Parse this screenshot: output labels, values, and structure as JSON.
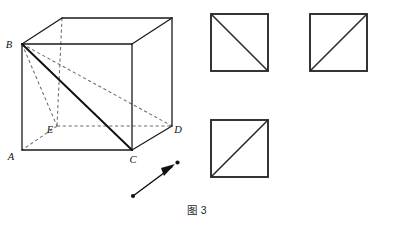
{
  "figure": {
    "caption": "图 3",
    "domain": "geometry-diagram",
    "background_color": "#ffffff",
    "stroke_color": "#111111",
    "hidden_stroke_color": "#6d6d6d"
  },
  "cube": {
    "title": "labelled cube with space diagonal",
    "vertices": {
      "A": {
        "label": "A",
        "x": 22,
        "y": 150,
        "label_x": 10,
        "label_y": 156
      },
      "B": {
        "label": "B",
        "x": 22,
        "y": 44,
        "label_x": 9,
        "label_y": 44
      },
      "C": {
        "label": "C",
        "x": 132,
        "y": 150,
        "label_x": 129,
        "label_y": 161
      },
      "D": {
        "label": "D",
        "x": 172,
        "y": 126,
        "label_x": 175,
        "label_y": 132
      },
      "E": {
        "label": "E",
        "x": 57,
        "y": 126,
        "label_x": 47,
        "label_y": 132
      },
      "F_top_front_right": {
        "x": 132,
        "y": 44
      },
      "G_top_back_left": {
        "x": 62,
        "y": 18
      },
      "H_top_back_right": {
        "x": 172,
        "y": 18
      }
    },
    "visible_edges": [
      "A-B",
      "A-C",
      "C-F",
      "B-F",
      "B-G",
      "G-H",
      "H-F",
      "H-D",
      "C-D"
    ],
    "hidden_edges": [
      "G-E",
      "E-A",
      "E-D"
    ],
    "bold_diagonal": "B-C",
    "construction_lines": [
      "B-E",
      "B-D",
      "B-C-dashed-guide"
    ]
  },
  "squares": [
    {
      "name": "square-top-left",
      "x": 211,
      "y": 14,
      "size": 57,
      "diagonal": "top-left-to-bottom-right"
    },
    {
      "name": "square-top-right",
      "x": 310,
      "y": 14,
      "size": 57,
      "diagonal": "bottom-left-to-top-right"
    },
    {
      "name": "square-bottom-middle",
      "x": 211,
      "y": 120,
      "size": 57,
      "diagonal": "bottom-left-to-top-right"
    }
  ],
  "arrow": {
    "name": "direction-arrow",
    "from_x": 133,
    "from_y": 196,
    "to_x": 177,
    "to_y": 163,
    "has_start_dot": true,
    "has_end_dot": true,
    "direction": "up-right"
  }
}
